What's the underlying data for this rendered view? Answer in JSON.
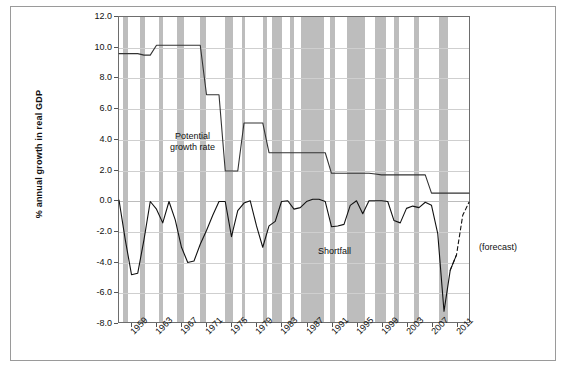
{
  "chart_data": {
    "type": "line",
    "title": "",
    "xlabel": "",
    "ylabel": "% annual growth in real  GDP",
    "ylim": [
      -8.0,
      12.0
    ],
    "xlim": [
      1957,
      2013
    ],
    "grid": true,
    "legend_position": "inline-annotations",
    "ytick_labels": [
      "12.0",
      "10.0",
      "8.0",
      "6.0",
      "4.0",
      "2.0",
      "0.0",
      "-2.0",
      "-4.0",
      "-6.0",
      "-8.0"
    ],
    "ytick_values": [
      12.0,
      10.0,
      8.0,
      6.0,
      4.0,
      2.0,
      0.0,
      -2.0,
      -4.0,
      -6.0,
      -8.0
    ],
    "xtick_labels": [
      "1959",
      "1963",
      "1967",
      "1971",
      "1975",
      "1979",
      "1983",
      "1987",
      "1991",
      "1995",
      "1999",
      "2003",
      "2007",
      "2011"
    ],
    "xtick_values": [
      1959,
      1963,
      1967,
      1971,
      1975,
      1979,
      1983,
      1987,
      1991,
      1995,
      1999,
      2003,
      2007,
      2011
    ],
    "x": [
      1957,
      1958,
      1959,
      1960,
      1961,
      1962,
      1963,
      1964,
      1965,
      1966,
      1967,
      1968,
      1969,
      1970,
      1971,
      1972,
      1973,
      1974,
      1975,
      1976,
      1977,
      1978,
      1979,
      1980,
      1981,
      1982,
      1983,
      1984,
      1985,
      1986,
      1987,
      1988,
      1989,
      1990,
      1991,
      1992,
      1993,
      1994,
      1995,
      1996,
      1997,
      1998,
      1999,
      2000,
      2001,
      2002,
      2003,
      2004,
      2005,
      2006,
      2007,
      2008,
      2009,
      2010,
      2011,
      2012,
      2013
    ],
    "series": [
      {
        "name": "Potential growth rate",
        "style": "solid",
        "color": "#333333",
        "values": [
          9.6,
          9.6,
          9.6,
          9.6,
          9.5,
          9.5,
          10.15,
          10.15,
          10.15,
          10.15,
          10.15,
          10.15,
          10.15,
          10.15,
          6.9,
          6.9,
          6.9,
          1.9,
          1.9,
          1.9,
          5.05,
          5.05,
          5.05,
          5.05,
          3.1,
          3.1,
          3.1,
          3.1,
          3.1,
          3.1,
          3.1,
          3.1,
          3.1,
          3.1,
          1.75,
          1.75,
          1.75,
          1.75,
          1.75,
          1.75,
          1.75,
          1.7,
          1.65,
          1.65,
          1.65,
          1.65,
          1.65,
          1.65,
          1.65,
          1.65,
          0.45,
          0.45,
          0.45,
          0.45,
          0.45,
          0.45,
          0.45
        ]
      },
      {
        "name": "Shortfall",
        "style": "solid",
        "color": "#111111",
        "values": [
          0.0,
          -2.6,
          -4.9,
          -4.8,
          -2.6,
          -0.1,
          -0.6,
          -1.5,
          -0.1,
          -1.3,
          -3.1,
          -4.1,
          -4.0,
          -2.9,
          -2.0,
          -1.0,
          -0.1,
          -0.1,
          -2.4,
          -0.7,
          -0.2,
          -0.05,
          -1.7,
          -3.1,
          -1.7,
          -1.4,
          -0.1,
          -0.05,
          -0.6,
          -0.5,
          -0.1,
          0.05,
          0.05,
          -0.1,
          -1.75,
          -1.7,
          -1.6,
          -0.35,
          -0.05,
          -0.9,
          -0.05,
          -0.05,
          -0.05,
          -0.1,
          -1.35,
          -1.5,
          -0.55,
          -0.4,
          -0.5,
          -0.15,
          -0.35,
          -2.2,
          -7.3,
          -4.6,
          -3.6,
          null,
          null
        ]
      },
      {
        "name": "(forecast)",
        "style": "dashed",
        "color": "#111111",
        "values": [
          null,
          null,
          null,
          null,
          null,
          null,
          null,
          null,
          null,
          null,
          null,
          null,
          null,
          null,
          null,
          null,
          null,
          null,
          null,
          null,
          null,
          null,
          null,
          null,
          null,
          null,
          null,
          null,
          null,
          null,
          null,
          null,
          null,
          null,
          null,
          null,
          null,
          null,
          null,
          null,
          null,
          null,
          null,
          null,
          null,
          null,
          null,
          null,
          null,
          null,
          null,
          null,
          null,
          -4.6,
          -3.6,
          -1.0,
          -0.15
        ]
      }
    ],
    "recession_bands": [
      {
        "start": 1957.6,
        "end": 1958.4
      },
      {
        "start": 1960.4,
        "end": 1961.2
      },
      {
        "start": 1963.3,
        "end": 1964.0
      },
      {
        "start": 1966.2,
        "end": 1967.4
      },
      {
        "start": 1969.9,
        "end": 1970.8
      },
      {
        "start": 1973.8,
        "end": 1975.2
      },
      {
        "start": 1976.6,
        "end": 1977.1
      },
      {
        "start": 1979.9,
        "end": 1980.6
      },
      {
        "start": 1981.4,
        "end": 1982.9
      },
      {
        "start": 1984.2,
        "end": 1984.9
      },
      {
        "start": 1986.0,
        "end": 1989.6
      },
      {
        "start": 1990.6,
        "end": 1991.3
      },
      {
        "start": 1993.2,
        "end": 1996.2
      },
      {
        "start": 1997.8,
        "end": 1999.5
      },
      {
        "start": 2000.8,
        "end": 2001.6
      },
      {
        "start": 2004.0,
        "end": 2004.7
      },
      {
        "start": 2007.9,
        "end": 2009.3
      }
    ],
    "annotations": [
      {
        "name": "potential-growth-rate",
        "text": "Potential\ngrowth rate",
        "line1": "Potential",
        "line2": "growth rate",
        "x_px": 170,
        "y_px": 131
      },
      {
        "name": "shortfall",
        "text": "Shortfall",
        "line1": "Shortfall",
        "line2": "",
        "x_px": 318,
        "y_px": 246
      },
      {
        "name": "forecast",
        "text": "(forecast)",
        "line1": "(forecast)",
        "line2": "",
        "x_px": 479,
        "y_px": 242
      }
    ]
  },
  "colors": {
    "recession_band": "#bdbdbd",
    "gridline": "#cfcfcf",
    "axis": "#6d6d6d",
    "series_line": "#111111",
    "frame": "#9a9a9a",
    "background": "#ffffff"
  }
}
